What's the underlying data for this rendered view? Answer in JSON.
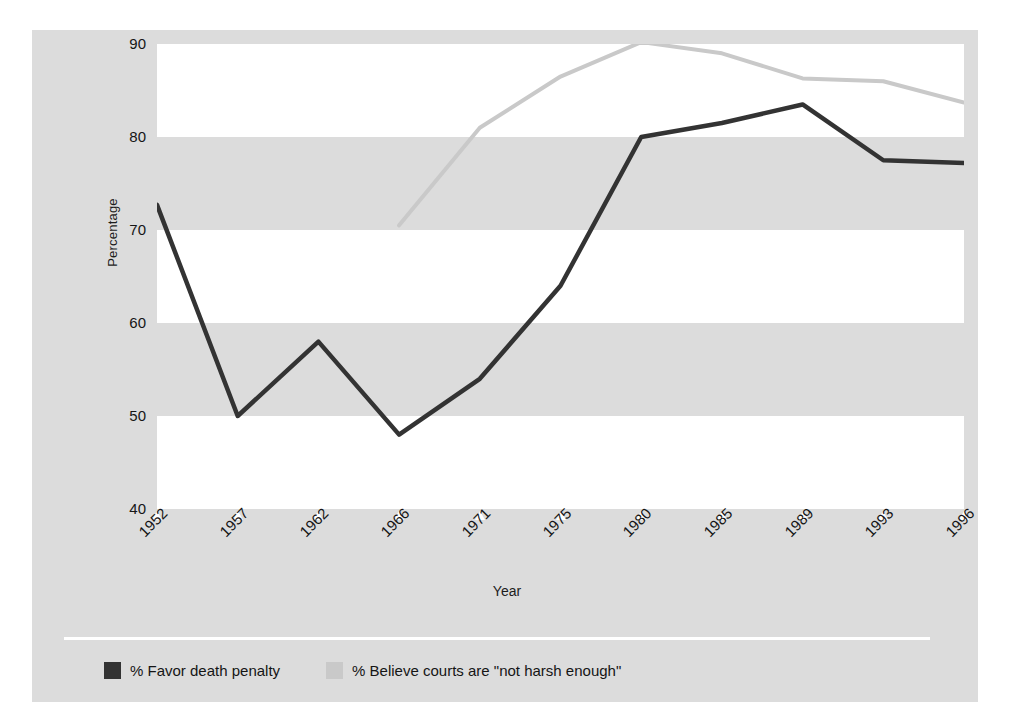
{
  "chart_data": {
    "type": "line",
    "title": "",
    "xlabel": "Year",
    "ylabel": "Percentage",
    "categories": [
      "1952",
      "1957",
      "1962",
      "1966",
      "1971",
      "1975",
      "1980",
      "1985",
      "1989",
      "1993",
      "1996"
    ],
    "ylim": [
      40,
      90
    ],
    "yticks": [
      40,
      50,
      60,
      70,
      80,
      90
    ],
    "grid": false,
    "banded_background": true,
    "legend_position": "bottom-left",
    "series": [
      {
        "name": "% Favor death penalty",
        "color": "#333333",
        "values": [
          72.7,
          50.0,
          58.0,
          48.0,
          54.0,
          64.0,
          80.0,
          81.5,
          83.5,
          77.5,
          77.2
        ]
      },
      {
        "name": "% Believe courts are \"not harsh enough\"",
        "color": "#c9c9c9",
        "values": [
          null,
          null,
          null,
          70.5,
          81.0,
          86.5,
          90.2,
          89.0,
          86.3,
          86.0,
          83.7
        ]
      }
    ]
  },
  "axis": {
    "y_label": "Percentage",
    "x_label": "Year",
    "y_tick_labels": [
      "90",
      "80",
      "70",
      "60",
      "50",
      "40"
    ],
    "x_tick_labels": [
      "1952",
      "1957",
      "1962",
      "1966",
      "1971",
      "1975",
      "1980",
      "1985",
      "1989",
      "1993",
      "1996"
    ]
  },
  "legend": {
    "items": [
      {
        "label": "% Favor death penalty",
        "color": "#333333"
      },
      {
        "label": "% Believe courts are \"not harsh enough\"",
        "color": "#c9c9c9"
      }
    ]
  },
  "colors": {
    "panel_background": "#dcdcdc",
    "band": "#ffffff",
    "series_dark": "#333333",
    "series_light": "#c9c9c9",
    "text": "#151515"
  }
}
